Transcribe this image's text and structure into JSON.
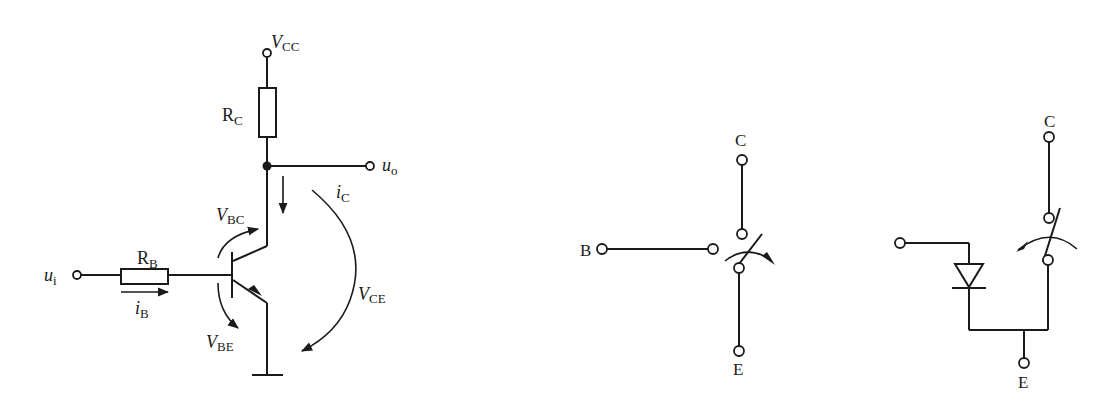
{
  "figure_left": {
    "title": "BJT common-emitter switching circuit",
    "labels": {
      "vcc": {
        "main": "V",
        "sub": "CC"
      },
      "rc": {
        "main": "R",
        "sub": "C"
      },
      "rb": {
        "main": "R",
        "sub": "B"
      },
      "ui": {
        "main": "u",
        "sub": "i"
      },
      "uo": {
        "main": "u",
        "sub": "o"
      },
      "ib": {
        "main": "i",
        "sub": "B"
      },
      "ic": {
        "main": "i",
        "sub": "C"
      },
      "vbc": {
        "main": "V",
        "sub": "BC"
      },
      "vbe": {
        "main": "V",
        "sub": "BE"
      },
      "vce": {
        "main": "V",
        "sub": "CE"
      }
    }
  },
  "figure_middle": {
    "title": "Transistor switch equivalent (saturated/cut-off)",
    "labels": {
      "b": "B",
      "c": "C",
      "e": "E"
    }
  },
  "figure_right": {
    "title": "Transistor switch equivalent with diode",
    "labels": {
      "c": "C",
      "e": "E"
    }
  },
  "colors": {
    "ink": "#1a1a1a",
    "background": "#ffffff"
  }
}
